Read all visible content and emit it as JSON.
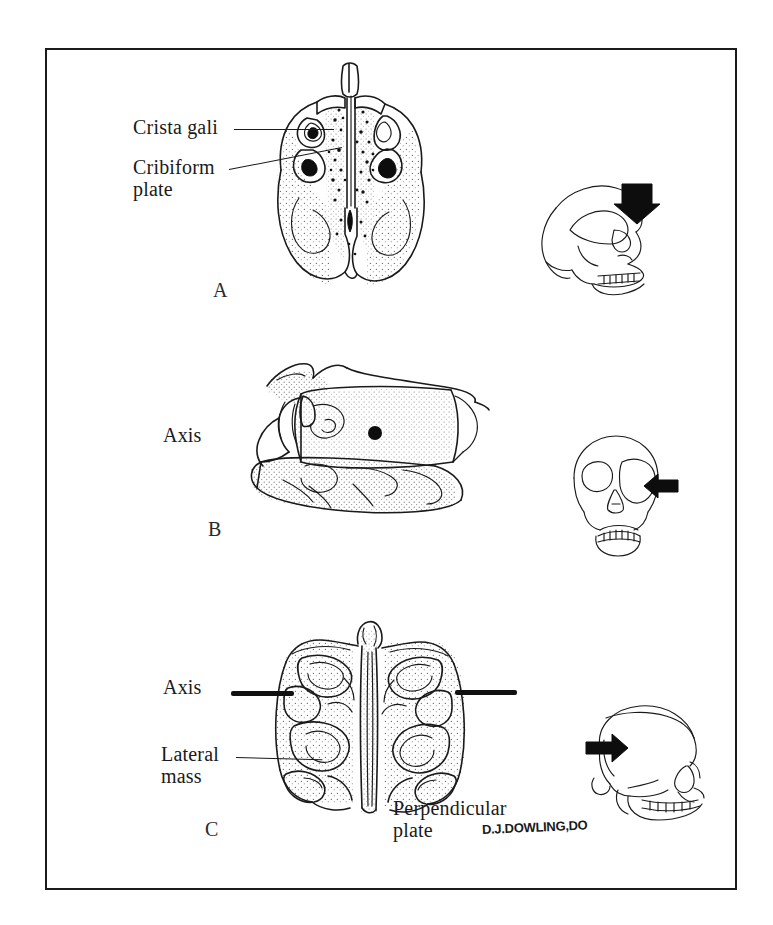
{
  "figure": {
    "title_visible": false,
    "border_color": "#1b1b1b",
    "background": "#ffffff",
    "signature": "D.J.DOWLING,DO"
  },
  "panels": [
    {
      "letter": "A",
      "view": "superior-view-ethmoid",
      "labels": [
        {
          "name": "crista-gali",
          "text": "Crista gali"
        },
        {
          "name": "cribiform-plate",
          "text": "Cribiform\nplate"
        }
      ],
      "inset": {
        "name": "skull-inset-lateral-superior-arrow",
        "orientation": "lateral-skull",
        "arrow_direction": "down"
      }
    },
    {
      "letter": "B",
      "view": "lateral-view-ethmoid",
      "labels": [
        {
          "name": "axis",
          "text": "Axis"
        }
      ],
      "marker": {
        "name": "axis-point-dot",
        "type": "dot"
      },
      "inset": {
        "name": "skull-inset-frontal-lateral-arrow",
        "orientation": "frontal-skull",
        "arrow_direction": "left"
      }
    },
    {
      "letter": "C",
      "view": "anterior-coronal-view-ethmoid",
      "labels": [
        {
          "name": "axis",
          "text": "Axis"
        },
        {
          "name": "lateral-mass",
          "text": "Lateral\nmass"
        },
        {
          "name": "perpendicular-plate",
          "text": "Perpendicular\nplate"
        }
      ],
      "marker": {
        "name": "axis-dash-pair",
        "type": "dashes",
        "count": 2
      },
      "inset": {
        "name": "skull-inset-lateral-anterior-arrow",
        "orientation": "lateral-skull",
        "arrow_direction": "right"
      }
    }
  ],
  "label_text": {
    "crista_gali": "Crista gali",
    "cribiform_line1": "Cribiform",
    "cribiform_line2": "plate",
    "axis_b": "Axis",
    "axis_c": "Axis",
    "lateral_line1": "Lateral",
    "lateral_line2": "mass",
    "perpendicular_line1": "Perpendicular",
    "perpendicular_line2": "plate",
    "letter_a": "A",
    "letter_b": "B",
    "letter_c": "C",
    "signature": "D.J.DOWLING,DO"
  },
  "colors": {
    "ink": "#1a1a1a",
    "solid_black": "#0d0d0d",
    "frame": "#1b1b1b",
    "paper": "#ffffff"
  }
}
